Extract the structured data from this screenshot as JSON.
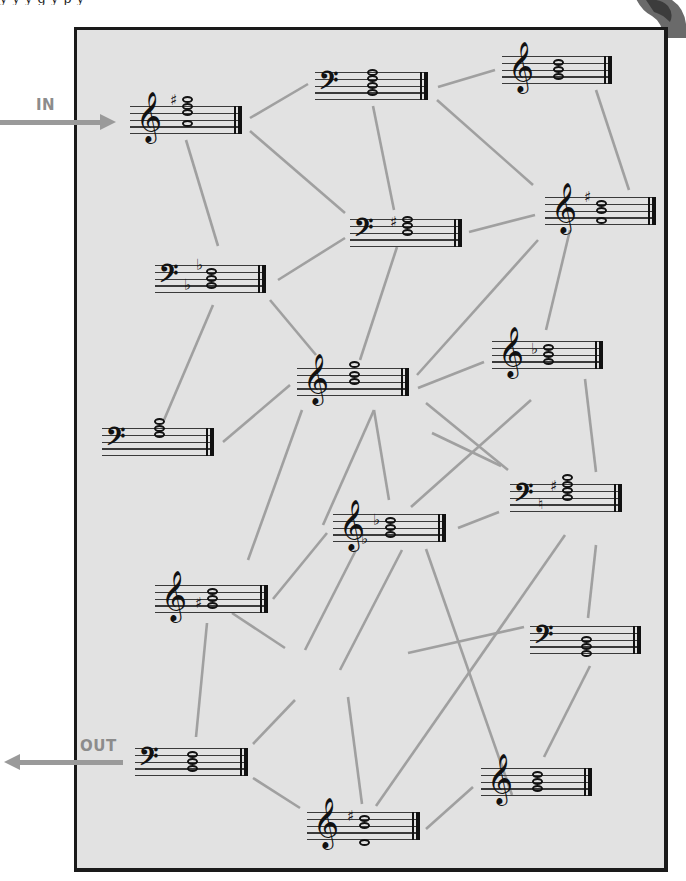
{
  "caption_fragment": "y   y   y  g     y  p   y",
  "labels": {
    "in": "IN",
    "out": "OUT"
  },
  "colors": {
    "panel": "#e2e2e2",
    "frame": "#1a1a1a",
    "link": "#a0a0a0",
    "arrow": "#9a9a9a",
    "ink": "#111111"
  },
  "nodes": [
    {
      "id": "n1",
      "clef": "treble",
      "x": 130,
      "y": 106,
      "w": 112,
      "notes": [
        -1,
        0,
        1,
        2.5
      ],
      "acc": [
        {
          "sym": "♯",
          "pos": -1.0,
          "dx": -12
        }
      ],
      "role": "in"
    },
    {
      "id": "n2",
      "clef": "bass",
      "x": 315,
      "y": 72,
      "w": 113,
      "notes": [
        0,
        1,
        2,
        3
      ],
      "acc": []
    },
    {
      "id": "n3",
      "clef": "treble",
      "x": 502,
      "y": 56,
      "w": 110,
      "notes": [
        1,
        2,
        3
      ],
      "acc": []
    },
    {
      "id": "n4",
      "clef": "bass",
      "x": 350,
      "y": 219,
      "w": 112,
      "notes": [
        0,
        1,
        2
      ],
      "acc": [
        {
          "sym": "♯",
          "pos": 0.3,
          "dx": -12
        }
      ]
    },
    {
      "id": "n5",
      "clef": "treble",
      "x": 545,
      "y": 197,
      "w": 111,
      "notes": [
        1,
        2,
        3.5
      ],
      "acc": [
        {
          "sym": "♯",
          "pos": -0.2,
          "dx": -12
        }
      ]
    },
    {
      "id": "n6",
      "clef": "bass",
      "x": 155,
      "y": 265,
      "w": 111,
      "notes": [
        1,
        2,
        3
      ],
      "acc": [
        {
          "sym": "♭",
          "pos": 2.8,
          "dx": -22
        },
        {
          "sym": "♭",
          "pos": -0.2,
          "dx": -10
        }
      ]
    },
    {
      "id": "n7",
      "clef": "treble",
      "x": 297,
      "y": 368,
      "w": 112,
      "notes": [
        -0.5,
        1,
        2
      ],
      "acc": []
    },
    {
      "id": "n8",
      "clef": "treble",
      "x": 492,
      "y": 341,
      "w": 111,
      "notes": [
        1,
        2,
        3
      ],
      "acc": [
        {
          "sym": "♭",
          "pos": 1.0,
          "dx": -12
        }
      ]
    },
    {
      "id": "n9",
      "clef": "bass",
      "x": 102,
      "y": 428,
      "w": 112,
      "notes": [
        -1,
        0,
        1
      ],
      "acc": []
    },
    {
      "id": "n10",
      "clef": "bass",
      "x": 510,
      "y": 484,
      "w": 112,
      "notes": [
        -1,
        0,
        1,
        2
      ],
      "acc": [
        {
          "sym": "♮",
          "pos": 2.8,
          "dx": -24
        },
        {
          "sym": "♯",
          "pos": 0.2,
          "dx": -12
        }
      ]
    },
    {
      "id": "n11",
      "clef": "treble",
      "x": 333,
      "y": 514,
      "w": 113,
      "notes": [
        1,
        2,
        3
      ],
      "acc": [
        {
          "sym": "♭",
          "pos": 3.5,
          "dx": -24
        },
        {
          "sym": "♭",
          "pos": 0.8,
          "dx": -12
        }
      ]
    },
    {
      "id": "n12",
      "clef": "treble",
      "x": 155,
      "y": 585,
      "w": 113,
      "notes": [
        1,
        2,
        3
      ],
      "acc": [
        {
          "sym": "♯",
          "pos": 2.5,
          "dx": -12
        }
      ]
    },
    {
      "id": "n13",
      "clef": "bass",
      "x": 530,
      "y": 626,
      "w": 111,
      "notes": [
        2,
        3,
        4
      ],
      "acc": []
    },
    {
      "id": "n14",
      "clef": "bass",
      "x": 135,
      "y": 748,
      "w": 113,
      "notes": [
        1,
        2,
        3
      ],
      "acc": [],
      "role": "out"
    },
    {
      "id": "n15",
      "clef": "treble",
      "x": 481,
      "y": 768,
      "w": 111,
      "notes": [
        1,
        2,
        3
      ],
      "acc": []
    },
    {
      "id": "n16",
      "clef": "treble",
      "x": 307,
      "y": 812,
      "w": 113,
      "notes": [
        1,
        2,
        4.5
      ],
      "acc": [
        {
          "sym": "♯",
          "pos": 0.5,
          "dx": -12
        }
      ]
    }
  ],
  "links": [
    [
      250,
      118,
      308,
      84
    ],
    [
      250,
      131,
      345,
      213
    ],
    [
      186,
      140,
      218,
      246
    ],
    [
      438,
      87,
      495,
      70
    ],
    [
      373,
      106,
      394,
      210
    ],
    [
      437,
      100,
      533,
      185
    ],
    [
      596,
      90,
      629,
      190
    ],
    [
      469,
      232,
      535,
      215
    ],
    [
      278,
      280,
      345,
      238
    ],
    [
      397,
      247,
      360,
      360
    ],
    [
      417,
      375,
      538,
      240
    ],
    [
      270,
      300,
      316,
      355
    ],
    [
      213,
      305,
      164,
      420
    ],
    [
      223,
      442,
      290,
      385
    ],
    [
      570,
      230,
      546,
      330
    ],
    [
      418,
      388,
      484,
      362
    ],
    [
      374,
      410,
      323,
      525
    ],
    [
      374,
      410,
      389,
      500
    ],
    [
      426,
      403,
      508,
      470
    ],
    [
      531,
      400,
      411,
      507
    ],
    [
      432,
      433,
      501,
      466
    ],
    [
      585,
      379,
      596,
      472
    ],
    [
      248,
      560,
      302,
      410
    ],
    [
      273,
      599,
      327,
      533
    ],
    [
      232,
      613,
      285,
      648
    ],
    [
      207,
      623,
      196,
      737
    ],
    [
      356,
      550,
      305,
      650
    ],
    [
      402,
      550,
      340,
      670
    ],
    [
      458,
      528,
      499,
      512
    ],
    [
      408,
      653,
      524,
      627
    ],
    [
      426,
      549,
      512,
      795
    ],
    [
      565,
      535,
      376,
      806
    ],
    [
      596,
      545,
      588,
      618
    ],
    [
      590,
      666,
      544,
      757
    ],
    [
      253,
      744,
      295,
      700
    ],
    [
      253,
      778,
      300,
      808
    ],
    [
      348,
      697,
      362,
      804
    ],
    [
      426,
      829,
      473,
      787
    ]
  ],
  "in_arrow": {
    "x1": 0,
    "x2": 100,
    "y": 122,
    "label_x": 36,
    "label_y": 96
  },
  "out_arrow": {
    "x1": 4,
    "x2": 123,
    "y": 762,
    "label_x": 80,
    "label_y": 737
  }
}
